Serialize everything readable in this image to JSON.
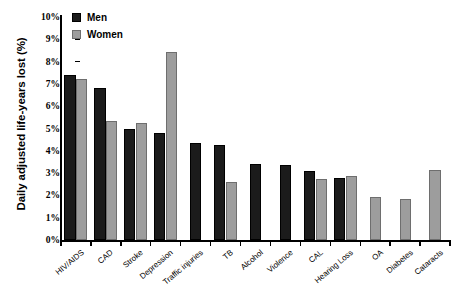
{
  "chart_data": {
    "type": "bar",
    "title": "",
    "xlabel": "",
    "ylabel": "Daily adjusted life-years lost (%)",
    "ylim": [
      0,
      10
    ],
    "ytick_labels": [
      "0%",
      "1%",
      "2%",
      "3%",
      "4%",
      "5%",
      "6%",
      "7%",
      "8%",
      "9%",
      "10%"
    ],
    "ytick_values": [
      0,
      1,
      2,
      3,
      4,
      5,
      6,
      7,
      8,
      9,
      10
    ],
    "grid": false,
    "legend_position": "top-left",
    "categories": [
      "HIV/AIDS",
      "CAD",
      "Stroke",
      "Depression",
      "Traffic injuries",
      "TB",
      "Alcohol",
      "Violence",
      "CAL",
      "Hearing Loss",
      "OA",
      "Diabetes",
      "Cataracts"
    ],
    "series": [
      {
        "name": "Men",
        "color": "#1b1b1b",
        "values": [
          7.4,
          6.8,
          5.0,
          4.8,
          4.35,
          4.25,
          3.4,
          3.35,
          3.1,
          2.8,
          null,
          null,
          null
        ]
      },
      {
        "name": "Women",
        "color": "#9d9d9d",
        "values": [
          7.2,
          5.35,
          5.25,
          8.45,
          null,
          2.6,
          null,
          null,
          2.75,
          2.85,
          1.95,
          1.85,
          3.15
        ]
      }
    ]
  },
  "legend": {
    "items": [
      {
        "label": "Men",
        "color": "#1b1b1b"
      },
      {
        "label": "Women",
        "color": "#9d9d9d"
      }
    ]
  }
}
